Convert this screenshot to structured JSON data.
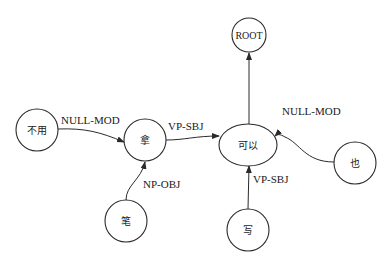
{
  "diagram": {
    "type": "dependency-tree",
    "nodes": [
      {
        "id": "root",
        "label": "ROOT",
        "shape": "circle",
        "cx": 249,
        "cy": 35,
        "r": 17
      },
      {
        "id": "buyong",
        "label": "不用",
        "shape": "circle",
        "cx": 37,
        "cy": 130,
        "r": 21
      },
      {
        "id": "na",
        "label": "拿",
        "shape": "circle",
        "cx": 145,
        "cy": 140,
        "r": 21
      },
      {
        "id": "keyi",
        "label": "可以",
        "shape": "ellipse",
        "cx": 248,
        "cy": 145,
        "rx": 29,
        "ry": 21
      },
      {
        "id": "ye",
        "label": "也",
        "shape": "circle",
        "cx": 355,
        "cy": 163,
        "r": 21
      },
      {
        "id": "bi",
        "label": "笔",
        "shape": "circle",
        "cx": 126,
        "cy": 221,
        "r": 21
      },
      {
        "id": "xie",
        "label": "写",
        "shape": "circle",
        "cx": 248,
        "cy": 230,
        "r": 21
      }
    ],
    "edges": [
      {
        "from": "keyi",
        "to": "root",
        "label": ""
      },
      {
        "from": "buyong",
        "to": "na",
        "label": "NULL-MOD"
      },
      {
        "from": "na",
        "to": "keyi",
        "label": "VP-SBJ"
      },
      {
        "from": "ye",
        "to": "keyi",
        "label": "NULL-MOD"
      },
      {
        "from": "bi",
        "to": "na",
        "label": "NP-OBJ"
      },
      {
        "from": "xie",
        "to": "keyi",
        "label": "VP-SBJ"
      }
    ]
  },
  "labels": {
    "root": "ROOT",
    "buyong": "不用",
    "na": "拿",
    "keyi": "可以",
    "ye": "也",
    "bi": "笔",
    "xie": "写",
    "edge_buyong_na": "NULL-MOD",
    "edge_na_keyi": "VP-SBJ",
    "edge_ye_keyi": "NULL-MOD",
    "edge_bi_na": "NP-OBJ",
    "edge_xie_keyi": "VP-SBJ"
  },
  "colors": {
    "stroke": "#2a2a2a",
    "text": "#1a1a1a",
    "background": "#ffffff"
  }
}
